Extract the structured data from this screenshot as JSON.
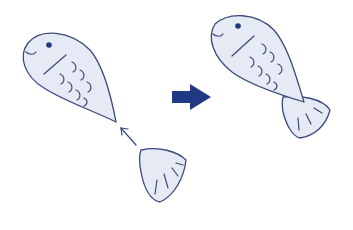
{
  "diagram": {
    "colors": {
      "fill": "#e6eaf4",
      "stroke": "#3a4a7a",
      "accent": "#1f3a82",
      "background": "#ffffff"
    },
    "parts": [
      {
        "id": "fish-body-before",
        "label": ""
      },
      {
        "id": "tail-fin-detached",
        "label": ""
      },
      {
        "id": "attach-arrow",
        "label": ""
      },
      {
        "id": "result-arrow",
        "label": ""
      },
      {
        "id": "fish-complete",
        "label": ""
      }
    ]
  }
}
